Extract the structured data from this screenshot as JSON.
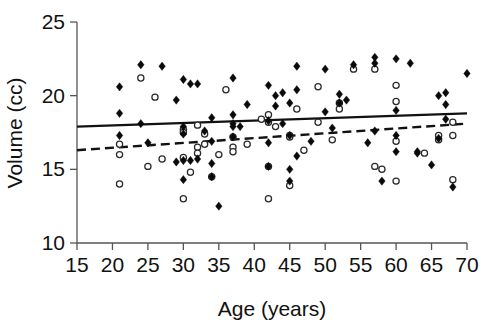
{
  "chart_data": {
    "type": "scatter",
    "title": "",
    "xlabel": "Age (years)",
    "ylabel": "Volume (cc)",
    "xlim": [
      15,
      70
    ],
    "ylim": [
      10,
      25
    ],
    "xticks": [
      15,
      20,
      25,
      30,
      35,
      40,
      45,
      50,
      55,
      60,
      65,
      70
    ],
    "yticks": [
      10,
      15,
      20,
      25
    ],
    "grid": false,
    "legend": "none",
    "series": [
      {
        "name": "filled-diamonds",
        "marker": "filled-diamond",
        "color": "#0a0a0a",
        "points": [
          [
            21,
            20.6
          ],
          [
            21,
            18.8
          ],
          [
            21,
            17.3
          ],
          [
            24,
            22.1
          ],
          [
            24,
            18.1
          ],
          [
            25,
            16.8
          ],
          [
            27,
            22.0
          ],
          [
            29,
            19.7
          ],
          [
            29,
            15.5
          ],
          [
            30,
            21.1
          ],
          [
            30,
            17.9
          ],
          [
            30,
            17.4
          ],
          [
            30,
            15.6
          ],
          [
            30,
            14.3
          ],
          [
            31,
            20.8
          ],
          [
            31,
            15.6
          ],
          [
            32,
            20.8
          ],
          [
            32,
            15.7
          ],
          [
            33,
            17.6
          ],
          [
            34,
            18.5
          ],
          [
            34,
            16.9
          ],
          [
            34,
            15.4
          ],
          [
            34,
            14.5
          ],
          [
            35,
            12.5
          ],
          [
            37,
            21.2
          ],
          [
            37,
            18.7
          ],
          [
            37,
            18.1
          ],
          [
            37,
            17.9
          ],
          [
            37,
            17.2
          ],
          [
            38,
            17.9
          ],
          [
            39,
            19.4
          ],
          [
            42,
            20.7
          ],
          [
            42,
            18.3
          ],
          [
            42,
            16.8
          ],
          [
            42,
            15.2
          ],
          [
            43,
            20.0
          ],
          [
            43,
            19.3
          ],
          [
            44,
            20.2
          ],
          [
            44,
            18.1
          ],
          [
            45,
            19.5
          ],
          [
            45,
            17.3
          ],
          [
            45,
            15.0
          ],
          [
            45,
            14.2
          ],
          [
            46,
            22.0
          ],
          [
            46,
            20.4
          ],
          [
            46,
            15.9
          ],
          [
            48,
            16.9
          ],
          [
            50,
            18.9
          ],
          [
            50,
            21.8
          ],
          [
            51,
            17.8
          ],
          [
            52,
            20.1
          ],
          [
            52,
            19.5
          ],
          [
            53,
            19.7
          ],
          [
            54,
            22.1
          ],
          [
            56,
            16.8
          ],
          [
            57,
            22.6
          ],
          [
            57,
            22.2
          ],
          [
            57,
            17.6
          ],
          [
            58,
            14.2
          ],
          [
            60,
            22.5
          ],
          [
            60,
            19.0
          ],
          [
            60,
            17.3
          ],
          [
            60,
            16.2
          ],
          [
            62,
            22.2
          ],
          [
            63,
            16.2
          ],
          [
            63,
            16.1
          ],
          [
            65,
            15.3
          ],
          [
            66,
            20.0
          ],
          [
            66,
            17.1
          ],
          [
            67,
            20.2
          ],
          [
            67,
            19.4
          ],
          [
            67,
            18.4
          ],
          [
            68,
            13.8
          ],
          [
            70,
            21.5
          ]
        ]
      },
      {
        "name": "open-circles",
        "marker": "open-circle",
        "color": "#2a2a2a",
        "points": [
          [
            21,
            16.7
          ],
          [
            21,
            16.0
          ],
          [
            21,
            14.0
          ],
          [
            24,
            21.2
          ],
          [
            25,
            15.2
          ],
          [
            26,
            19.9
          ],
          [
            27,
            15.7
          ],
          [
            30,
            17.7
          ],
          [
            30,
            17.5
          ],
          [
            30,
            15.8
          ],
          [
            30,
            13.0
          ],
          [
            31,
            14.8
          ],
          [
            32,
            18.0
          ],
          [
            32,
            16.5
          ],
          [
            32,
            16.1
          ],
          [
            33,
            17.4
          ],
          [
            33,
            16.7
          ],
          [
            34,
            14.5
          ],
          [
            35,
            16.0
          ],
          [
            36,
            20.4
          ],
          [
            37,
            17.2
          ],
          [
            37,
            16.5
          ],
          [
            37,
            16.2
          ],
          [
            39,
            16.7
          ],
          [
            41,
            18.4
          ],
          [
            42,
            18.7
          ],
          [
            42,
            18.2
          ],
          [
            42,
            15.2
          ],
          [
            42,
            13.0
          ],
          [
            43,
            17.9
          ],
          [
            45,
            17.3
          ],
          [
            45,
            17.2
          ],
          [
            45,
            13.9
          ],
          [
            46,
            19.1
          ],
          [
            47,
            16.3
          ],
          [
            49,
            20.6
          ],
          [
            49,
            18.2
          ],
          [
            51,
            17.0
          ],
          [
            52,
            19.5
          ],
          [
            52,
            19.1
          ],
          [
            54,
            21.8
          ],
          [
            57,
            21.8
          ],
          [
            57,
            15.2
          ],
          [
            58,
            15.0
          ],
          [
            60,
            20.7
          ],
          [
            60,
            19.6
          ],
          [
            60,
            16.9
          ],
          [
            60,
            14.2
          ],
          [
            64,
            16.1
          ],
          [
            66,
            17.3
          ],
          [
            66,
            17.0
          ],
          [
            68,
            18.2
          ],
          [
            68,
            17.3
          ],
          [
            68,
            14.3
          ]
        ]
      }
    ],
    "trendlines": [
      {
        "name": "solid-trendline",
        "style": "solid",
        "x_start": 15,
        "y_start": 17.9,
        "x_end": 70,
        "y_end": 18.8
      },
      {
        "name": "dashed-trendline",
        "style": "dashed",
        "x_start": 15,
        "y_start": 16.3,
        "x_end": 70,
        "y_end": 18.1
      }
    ]
  }
}
